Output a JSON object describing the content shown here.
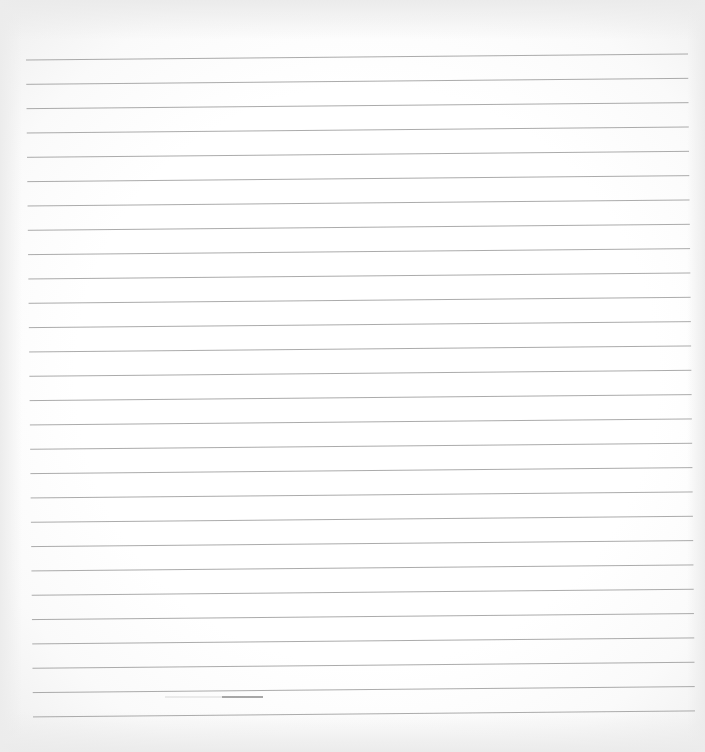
{
  "scene": {
    "description": "Photo of a blank sheet of ruled notebook paper",
    "background_color": "#fdfdfd",
    "edge_shadow_color": "#ebebeb"
  },
  "ruled_lines": {
    "count": 28,
    "color": "#9c9c9c",
    "first_left_y": 60,
    "first_right_y": 54,
    "spacing": 24.33,
    "left_x_top": 26,
    "left_x_bottom": 33,
    "right_x_top": 688,
    "right_x_bottom": 695
  },
  "pencil_mark": {
    "faint_start_x": 165,
    "dark_start_x": 222,
    "end_x": 263,
    "y": 697,
    "color_faint": "#d8d8d8",
    "color_dark": "#8a8a8a"
  }
}
